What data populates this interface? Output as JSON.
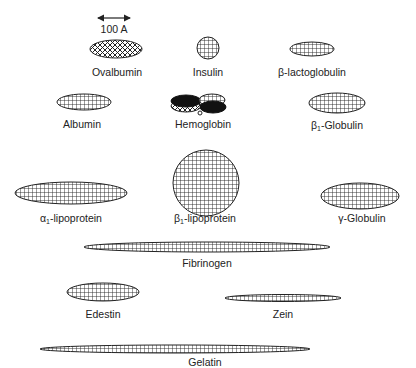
{
  "scale_bar": {
    "label": "100 A",
    "length_angstrom": 100
  },
  "proteins": [
    {
      "id": "ovalbumin",
      "name": "Ovalbumin",
      "shape": "ellipse",
      "pattern": "crosshatch"
    },
    {
      "id": "insulin",
      "name": "Insulin",
      "shape": "circle",
      "pattern": "grid"
    },
    {
      "id": "beta-lactoglobulin",
      "name": "β-lactoglobulin",
      "shape": "ellipse",
      "pattern": "grid"
    },
    {
      "id": "albumin",
      "name": "Albumin",
      "shape": "ellipse",
      "pattern": "grid"
    },
    {
      "id": "hemoglobin",
      "name": "Hemoglobin",
      "shape": "tetramer",
      "pattern": "mixed"
    },
    {
      "id": "beta1-globulin",
      "name_prefix": "β",
      "name_sub": "1",
      "name_suffix": "-Globulin",
      "shape": "ellipse",
      "pattern": "grid"
    },
    {
      "id": "alpha1-lipoprotein",
      "name_prefix": "α",
      "name_sub": "1",
      "name_suffix": "-lipoprotein",
      "shape": "ellipse",
      "pattern": "grid"
    },
    {
      "id": "beta1-lipoprotein",
      "name_prefix": "β",
      "name_sub": "1",
      "name_suffix": "-lipoprotein",
      "shape": "circle",
      "pattern": "grid"
    },
    {
      "id": "gamma-globulin",
      "name": "γ-Globulin",
      "shape": "ellipse",
      "pattern": "grid"
    },
    {
      "id": "fibrinogen",
      "name": "Fibrinogen",
      "shape": "elongated-ellipse",
      "pattern": "grid"
    },
    {
      "id": "edestin",
      "name": "Edestin",
      "shape": "ellipse",
      "pattern": "grid"
    },
    {
      "id": "zein",
      "name": "Zein",
      "shape": "elongated-ellipse",
      "pattern": "grid"
    },
    {
      "id": "gelatin",
      "name": "Gelatin",
      "shape": "elongated-ellipse",
      "pattern": "grid"
    }
  ]
}
